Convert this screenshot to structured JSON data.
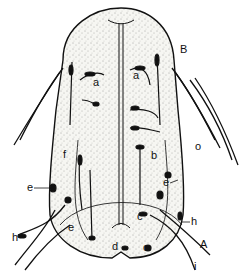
{
  "figure": {
    "stroke_color": "#111111",
    "fill_color": "#f4f4f0",
    "labels": [
      {
        "text": "B",
        "x": 180,
        "y": 44
      },
      {
        "text": "a",
        "x": 93,
        "y": 77
      },
      {
        "text": "a",
        "x": 133,
        "y": 70
      },
      {
        "text": "o",
        "x": 195,
        "y": 141
      },
      {
        "text": "f",
        "x": 63,
        "y": 149
      },
      {
        "text": "b",
        "x": 151,
        "y": 150
      },
      {
        "text": "e",
        "x": 27,
        "y": 182
      },
      {
        "text": "e",
        "x": 163,
        "y": 177
      },
      {
        "text": "c",
        "x": 137,
        "y": 211
      },
      {
        "text": "h",
        "x": 191,
        "y": 216
      },
      {
        "text": "e",
        "x": 68,
        "y": 222
      },
      {
        "text": "h",
        "x": 12,
        "y": 232
      },
      {
        "text": "A",
        "x": 200,
        "y": 239
      },
      {
        "text": "d",
        "x": 112,
        "y": 241
      },
      {
        "text": "o",
        "x": 143,
        "y": 242
      },
      {
        "text": "i",
        "x": 194,
        "y": 261
      }
    ]
  }
}
